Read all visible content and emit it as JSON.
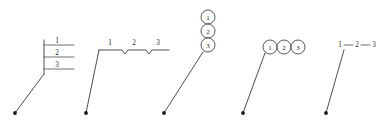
{
  "figure": {
    "type": "technical-drawing-annotation-styles",
    "background_color": "#ffffff",
    "line_color": "#3a3a3a",
    "text_color": "#2b2b2b",
    "width": 385,
    "height": 127
  },
  "variants": [
    {
      "id": "stacked-underlined",
      "style": "vertical-bracket-stacked-labels",
      "items": [
        "1",
        "2",
        "3"
      ],
      "leader": {
        "x1": 15,
        "y1": 113,
        "x2": 44,
        "y2": 74
      },
      "spine": {
        "x": 44,
        "y1": 40,
        "y2": 74
      },
      "rows": [
        {
          "label": "1",
          "line_x1": 44,
          "line_x2": 74,
          "line_y": 45,
          "text_x": 57,
          "text_y": 43
        },
        {
          "label": "2",
          "line_x1": 44,
          "line_x2": 74,
          "line_y": 57,
          "text_x": 57,
          "text_y": 55
        },
        {
          "label": "3",
          "line_x1": 44,
          "line_x2": 74,
          "line_y": 69,
          "text_x": 57,
          "text_y": 67
        }
      ]
    },
    {
      "id": "notched-horizontal",
      "style": "horizontal-line-with-v-notches",
      "items": [
        "1",
        "2",
        "3"
      ],
      "leader": {
        "x1": 86,
        "y1": 113,
        "x2": 99,
        "y2": 50
      },
      "baseline_y": 50,
      "baseline_x1": 99,
      "baseline_x2": 169,
      "notches": [
        {
          "x": 122,
          "depth": 4
        },
        {
          "x": 146,
          "depth": 4
        }
      ],
      "labels": [
        {
          "label": "1",
          "x": 110,
          "y": 45
        },
        {
          "label": "2",
          "x": 134,
          "y": 45
        },
        {
          "label": "3",
          "x": 158,
          "y": 45
        }
      ]
    },
    {
      "id": "balloons-vertical",
      "style": "stacked-circle-balloons",
      "items": [
        "1",
        "2",
        "3"
      ],
      "leader": {
        "x1": 164,
        "y1": 113,
        "x2": 203,
        "y2": 52
      },
      "radius": 7,
      "balloons": [
        {
          "label": "1",
          "cx": 208,
          "cy": 17
        },
        {
          "label": "2",
          "cx": 208,
          "cy": 31
        },
        {
          "label": "3",
          "cx": 208,
          "cy": 45
        }
      ]
    },
    {
      "id": "balloons-horizontal",
      "style": "inline-circle-balloons",
      "items": [
        "1",
        "2",
        "3"
      ],
      "leader": {
        "x1": 243,
        "y1": 113,
        "x2": 265,
        "y2": 53
      },
      "radius": 7,
      "balloons": [
        {
          "label": "1",
          "cx": 270,
          "cy": 47
        },
        {
          "label": "2",
          "cx": 284,
          "cy": 47
        },
        {
          "label": "3",
          "cx": 298,
          "cy": 47
        }
      ]
    },
    {
      "id": "dash-separated",
      "style": "inline-dash-separated-numbers",
      "items": [
        "1",
        "2",
        "3"
      ],
      "leader": {
        "x1": 326,
        "y1": 113,
        "x2": 344,
        "y2": 50
      },
      "labels": [
        {
          "label": "1",
          "x": 340,
          "y": 47
        },
        {
          "label": "2",
          "x": 357,
          "y": 47
        },
        {
          "label": "3",
          "x": 374,
          "y": 47
        }
      ],
      "separators": [
        {
          "x1": 344,
          "x2": 353,
          "y": 45
        },
        {
          "x1": 361,
          "x2": 370,
          "y": 45
        }
      ]
    }
  ]
}
